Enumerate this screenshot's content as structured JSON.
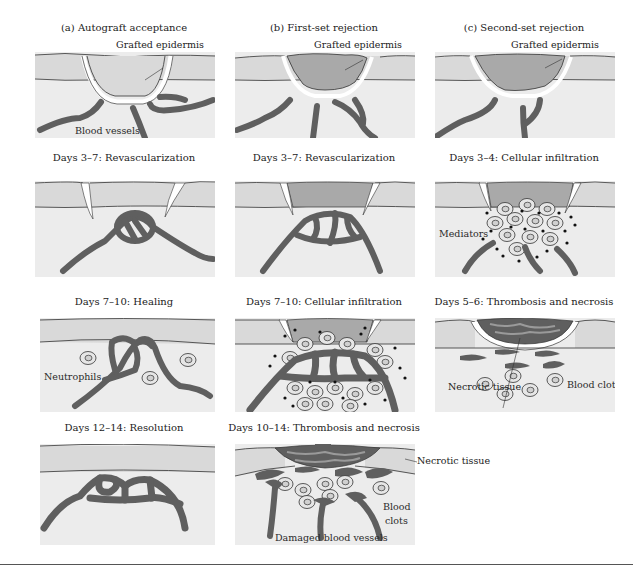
{
  "figure": {
    "columns": [
      {
        "id": "a",
        "heading": "(a) Autograft acceptance"
      },
      {
        "id": "b",
        "heading": "(b) First-set rejection"
      },
      {
        "id": "c",
        "heading": "(c) Second-set rejection"
      }
    ],
    "panels": {
      "a1": {
        "title": "(a) Autograft acceptance",
        "labels": {
          "graft": "Grafted epidermis",
          "vessels": "Blood vessels"
        }
      },
      "a2": {
        "title": "Days 3–7: Revascularization"
      },
      "a3": {
        "title": "Days 7–10: Healing",
        "labels": {
          "neutrophils": "Neutrophils"
        }
      },
      "a4": {
        "title": "Days 12–14: Resolution"
      },
      "b1": {
        "title": "(b) First-set rejection",
        "labels": {
          "graft": "Grafted epidermis"
        }
      },
      "b2": {
        "title": "Days 3–7: Revascularization"
      },
      "b3": {
        "title": "Days 7–10: Cellular infiltration"
      },
      "b4": {
        "title": "Days 10–14: Thrombosis and necrosis",
        "labels": {
          "necrotic": "Necrotic tissue",
          "clots_1": "Blood",
          "clots_2": "clots",
          "damaged": "Damaged blood vessels"
        }
      },
      "c1": {
        "title": "(c) Second-set rejection",
        "labels": {
          "graft": "Grafted epidermis"
        }
      },
      "c2": {
        "title": "Days 3–4: Cellular infiltration",
        "labels": {
          "mediators": "Mediators"
        }
      },
      "c3": {
        "title": "Days 5–6: Thrombosis and necrosis",
        "labels": {
          "clots": "Blood clots",
          "necrotic": "Necrotic tissue"
        }
      }
    },
    "colors": {
      "epidermis": "#d9d9d9",
      "dermis": "#ececec",
      "graft": "#a9a9a9",
      "vessel": "#5f5f5f",
      "outline": "#3a3a3a"
    }
  }
}
